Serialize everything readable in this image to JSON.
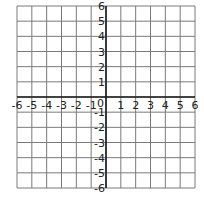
{
  "diagram": {
    "type": "coordinate-plane",
    "x_range": [
      -6,
      6
    ],
    "y_range": [
      -6,
      6
    ],
    "grid_step": 1,
    "origin_label": "0",
    "x_tick_labels": [
      "-6",
      "-5",
      "-4",
      "-3",
      "-2",
      "-1",
      "1",
      "2",
      "3",
      "4",
      "5",
      "6"
    ],
    "y_tick_labels": [
      "6",
      "5",
      "4",
      "3",
      "2",
      "1",
      "-1",
      "-2",
      "-3",
      "-4",
      "-5",
      "-6"
    ],
    "colors": {
      "background": "#ffffff",
      "grid_line": "#7a7a7a",
      "axis_line": "#1a1a1a",
      "label": "#222222"
    }
  }
}
